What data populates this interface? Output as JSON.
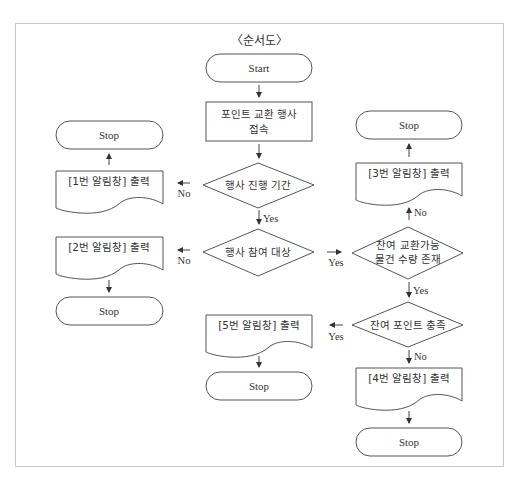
{
  "title": "〈순서도〉",
  "nodes": {
    "start": {
      "type": "terminal",
      "label": "Start"
    },
    "access": {
      "type": "process",
      "label_line1": "포인트 교환 행사",
      "label_line2": "접속"
    },
    "period": {
      "type": "decision",
      "label": "행사 진행 기간"
    },
    "eligible": {
      "type": "decision",
      "label": "행사 참여 대상"
    },
    "stock": {
      "type": "decision",
      "label_line1": "잔여 교환가능",
      "label_line2": "물건 수량 존재"
    },
    "points": {
      "type": "decision",
      "label": "잔여 포인트 충족"
    },
    "alert1": {
      "type": "document",
      "label": "[1번 알림창] 출력"
    },
    "alert2": {
      "type": "document",
      "label": "[2번 알림창] 출력"
    },
    "alert3": {
      "type": "document",
      "label": "[3번 알림창] 출력"
    },
    "alert4": {
      "type": "document",
      "label": "[4번 알림창] 출력"
    },
    "alert5": {
      "type": "document",
      "label": "[5번 알림창] 출력"
    },
    "stop1": {
      "type": "terminal",
      "label": "Stop"
    },
    "stop2": {
      "type": "terminal",
      "label": "Stop"
    },
    "stop3": {
      "type": "terminal",
      "label": "Stop"
    },
    "stop4": {
      "type": "terminal",
      "label": "Stop"
    },
    "stop5": {
      "type": "terminal",
      "label": "Stop"
    }
  },
  "edges": [
    {
      "from": "start",
      "to": "access",
      "label": ""
    },
    {
      "from": "access",
      "to": "period",
      "label": ""
    },
    {
      "from": "period",
      "to": "alert1",
      "label": "No"
    },
    {
      "from": "period",
      "to": "eligible",
      "label": "Yes"
    },
    {
      "from": "alert1",
      "to": "stop1",
      "label": ""
    },
    {
      "from": "eligible",
      "to": "alert2",
      "label": "No"
    },
    {
      "from": "eligible",
      "to": "stock",
      "label": "Yes"
    },
    {
      "from": "alert2",
      "to": "stop2",
      "label": ""
    },
    {
      "from": "stock",
      "to": "alert3",
      "label": "No"
    },
    {
      "from": "stock",
      "to": "points",
      "label": "Yes"
    },
    {
      "from": "alert3",
      "to": "stop3",
      "label": ""
    },
    {
      "from": "points",
      "to": "alert5",
      "label": "Yes"
    },
    {
      "from": "points",
      "to": "alert4",
      "label": "No"
    },
    {
      "from": "alert5",
      "to": "stop5",
      "label": ""
    },
    {
      "from": "alert4",
      "to": "stop4",
      "label": ""
    }
  ],
  "edge_labels": {
    "period_no": "No",
    "period_yes": "Yes",
    "eligible_no": "No",
    "eligible_yes": "Yes",
    "stock_no": "No",
    "stock_yes": "Yes",
    "points_yes": "Yes",
    "points_no": "No"
  }
}
